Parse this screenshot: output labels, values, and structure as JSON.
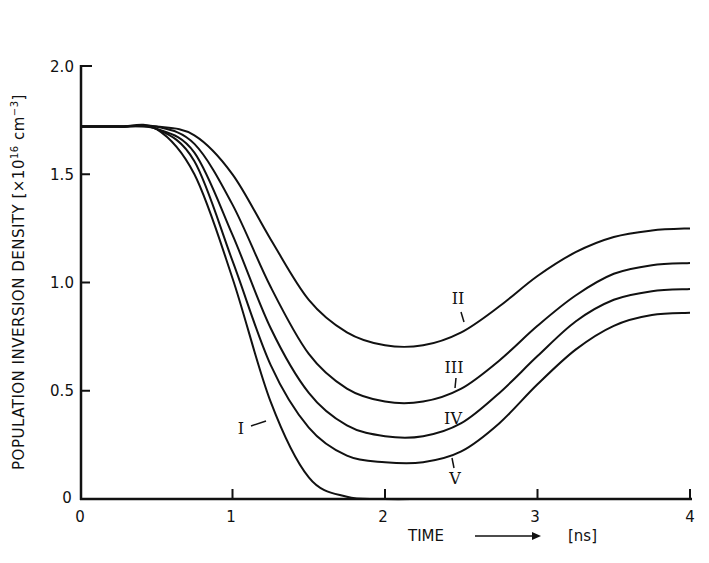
{
  "chart_data": {
    "type": "line",
    "title": "",
    "xlabel": "TIME",
    "xlabel_arrow": "→",
    "xunit": "[ns]",
    "ylabel": "POPULATION INVERSION DENSITY [×10^16 cm^-3]",
    "xlim": [
      0,
      4
    ],
    "ylim": [
      0,
      2.0
    ],
    "x_ticks": [
      "0",
      "1",
      "2",
      "3",
      "4"
    ],
    "y_ticks": [
      "0",
      "0.5",
      "1.0",
      "1.5",
      "2.0"
    ],
    "grid": false,
    "legend": "inline curve labels",
    "x": [
      0,
      0.25,
      0.5,
      0.75,
      1.0,
      1.25,
      1.5,
      1.75,
      2.0,
      2.25,
      2.5,
      2.75,
      3.0,
      3.25,
      3.5,
      3.75,
      4.0
    ],
    "series": [
      {
        "name": "I",
        "values": [
          1.72,
          1.72,
          1.71,
          1.5,
          1.02,
          0.45,
          0.1,
          0.01,
          0.0,
          0.0,
          0.0,
          0.0,
          0.0,
          0.0,
          0.0,
          0.0,
          0.0
        ]
      },
      {
        "name": "II",
        "values": [
          1.72,
          1.72,
          1.72,
          1.68,
          1.5,
          1.2,
          0.92,
          0.77,
          0.71,
          0.71,
          0.77,
          0.89,
          1.03,
          1.14,
          1.21,
          1.24,
          1.25
        ]
      },
      {
        "name": "III",
        "values": [
          1.72,
          1.72,
          1.72,
          1.64,
          1.36,
          0.98,
          0.67,
          0.51,
          0.45,
          0.45,
          0.51,
          0.64,
          0.8,
          0.94,
          1.04,
          1.08,
          1.09
        ]
      },
      {
        "name": "IV",
        "values": [
          1.72,
          1.72,
          1.71,
          1.6,
          1.22,
          0.79,
          0.49,
          0.34,
          0.29,
          0.29,
          0.35,
          0.49,
          0.66,
          0.82,
          0.92,
          0.96,
          0.97
        ]
      },
      {
        "name": "V",
        "values": [
          1.72,
          1.72,
          1.71,
          1.56,
          1.1,
          0.62,
          0.33,
          0.2,
          0.17,
          0.17,
          0.22,
          0.35,
          0.53,
          0.69,
          0.8,
          0.85,
          0.86
        ]
      }
    ]
  },
  "labels": {
    "ylabel_main": "POPULATION  INVERSION  DENSITY [",
    "ylabel_mult": "×10",
    "ylabel_exp": "16",
    "ylabel_unit": "cm",
    "ylabel_unit_exp": "−3",
    "ylabel_close": "]",
    "x_ticks": [
      "0",
      "1",
      "2",
      "3",
      "4"
    ],
    "y_ticks": [
      "0",
      "0.5",
      "1.0",
      "1.5",
      "2.0"
    ],
    "xlabel": "TIME",
    "xunit": "[ns]",
    "curves": [
      "I",
      "II",
      "III",
      "IV",
      "V"
    ]
  }
}
